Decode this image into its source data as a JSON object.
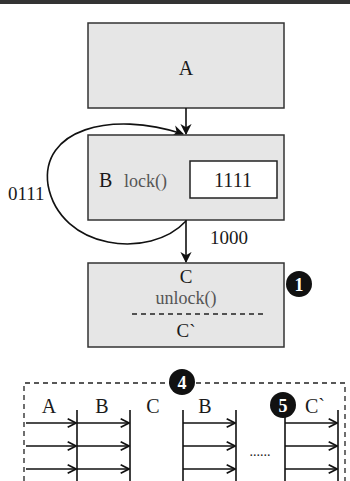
{
  "diagram": {
    "boxes": {
      "a": {
        "label": "A"
      },
      "b": {
        "label": "B",
        "method": "lock()",
        "value": "1111"
      },
      "c": {
        "label": "C",
        "method": "unlock()",
        "sublabel": "C`"
      }
    },
    "edges": {
      "loop_label": "0111",
      "b_to_c_label": "1000"
    },
    "badges": {
      "one": "1",
      "four": "4",
      "five": "5"
    },
    "timeline": {
      "columns": [
        "A",
        "B",
        "C",
        "B",
        "C`"
      ],
      "ellipsis": "......"
    },
    "colors": {
      "box_fill": "#e6e6e6",
      "stroke": "#333333",
      "badge": "#111111"
    }
  }
}
